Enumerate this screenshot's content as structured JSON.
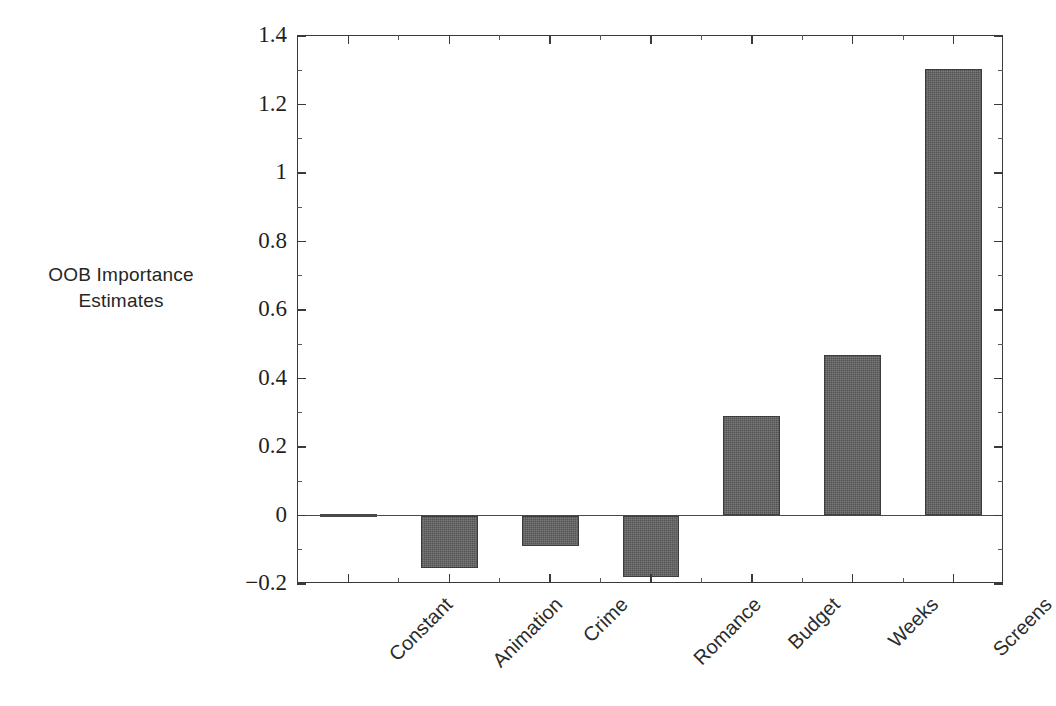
{
  "chart_data": {
    "type": "bar",
    "title": "",
    "xlabel": "",
    "ylabel": "OOB Importance Estimates",
    "ylabel_lines": [
      "OOB Importance",
      "Estimates"
    ],
    "categories": [
      "Constant",
      "Animation",
      "Crime",
      "Romance",
      "Budget",
      "Weeks",
      "Screens"
    ],
    "values": [
      0.003,
      -0.153,
      -0.09,
      -0.18,
      0.29,
      0.47,
      1.305
    ],
    "ylim": [
      -0.2,
      1.4
    ],
    "ytick_labels": [
      "1.4",
      "1.2",
      "1",
      "0.8",
      "0.6",
      "0.4",
      "0.2",
      "0",
      "−0.2"
    ],
    "ytick_values": [
      1.4,
      1.2,
      1.0,
      0.8,
      0.6,
      0.4,
      0.2,
      0.0,
      -0.2
    ],
    "yminor_values": [
      1.3,
      1.1,
      0.9,
      0.7,
      0.5,
      0.3,
      0.1,
      -0.1
    ],
    "grid": false,
    "legend": null,
    "bar_color": "#5c5c5c",
    "bar_edge_color": "#3d3d3d",
    "axis_color": "#3a3a3a",
    "background": "#ffffff",
    "zero_line": 0
  }
}
